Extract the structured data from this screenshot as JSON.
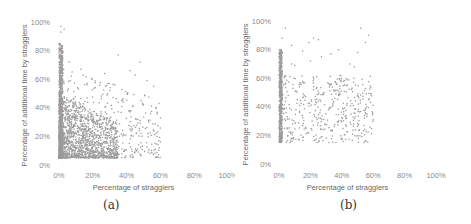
{
  "chart_data": [
    {
      "type": "scatter",
      "caption": "(a)",
      "title": "",
      "xlabel": "Percentage of stragglers",
      "ylabel": "Percentage of additional time by stragglers",
      "xlim": [
        0,
        100
      ],
      "ylim": [
        0,
        100
      ],
      "xticks": [
        "0%",
        "20%",
        "40%",
        "60%",
        "80%",
        "100%"
      ],
      "yticks": [
        "0%",
        "20%",
        "40%",
        "60%",
        "80%",
        "100%"
      ],
      "grid": false,
      "legend": "none",
      "point_color": "#9b9b9b",
      "distribution": {
        "description": "Dense cluster near x=0-20%, y=5-40%, concentrated column at x≈0-2% spanning up to ~98%; sparse tail to x≈60%",
        "count": 2600,
        "x_range": [
          0,
          60
        ],
        "y_range": [
          5,
          98
        ],
        "seed": 7
      },
      "notable_points": [
        {
          "x": 1,
          "y": 97
        },
        {
          "x": 3,
          "y": 95
        },
        {
          "x": 1,
          "y": 93
        },
        {
          "x": 6,
          "y": 72
        },
        {
          "x": 13,
          "y": 67
        },
        {
          "x": 27,
          "y": 64
        },
        {
          "x": 35,
          "y": 77
        },
        {
          "x": 48,
          "y": 72
        },
        {
          "x": 42,
          "y": 66
        },
        {
          "x": 45,
          "y": 63
        },
        {
          "x": 52,
          "y": 59
        },
        {
          "x": 56,
          "y": 55
        },
        {
          "x": 58,
          "y": 20
        },
        {
          "x": 59,
          "y": 17
        },
        {
          "x": 57,
          "y": 11
        },
        {
          "x": 50,
          "y": 42
        },
        {
          "x": 38,
          "y": 44
        },
        {
          "x": 33,
          "y": 56
        }
      ]
    },
    {
      "type": "scatter",
      "caption": "(b)",
      "title": "",
      "xlabel": "Percentage of stragglers",
      "ylabel": "Percentage of additional time by stragglers",
      "xlim": [
        0,
        100
      ],
      "ylim": [
        0,
        100
      ],
      "xticks": [
        "0%",
        "20%",
        "40%",
        "60%",
        "80%",
        "100%"
      ],
      "yticks": [
        "0%",
        "20%",
        "40%",
        "60%",
        "80%",
        "100%"
      ],
      "grid": false,
      "legend": "none",
      "point_color": "#9b9b9b",
      "distribution": {
        "description": "Dense vertical column at x≈0-2% spanning y≈15-80%; sparse points across x≈3-60%, y≈15-60%",
        "count": 900,
        "x_range": [
          0,
          60
        ],
        "y_range": [
          14,
          96
        ],
        "seed": 13
      },
      "notable_points": [
        {
          "x": 4,
          "y": 95
        },
        {
          "x": 52,
          "y": 95
        },
        {
          "x": 2,
          "y": 88
        },
        {
          "x": 57,
          "y": 90
        },
        {
          "x": 22,
          "y": 88
        },
        {
          "x": 25,
          "y": 87
        },
        {
          "x": 19,
          "y": 85
        },
        {
          "x": 55,
          "y": 85
        },
        {
          "x": 8,
          "y": 83
        },
        {
          "x": 15,
          "y": 79
        },
        {
          "x": 38,
          "y": 80
        },
        {
          "x": 50,
          "y": 78
        },
        {
          "x": 33,
          "y": 77
        },
        {
          "x": 27,
          "y": 75
        },
        {
          "x": 20,
          "y": 72
        },
        {
          "x": 45,
          "y": 70
        },
        {
          "x": 48,
          "y": 68
        },
        {
          "x": 8,
          "y": 70
        },
        {
          "x": 10,
          "y": 69
        }
      ]
    }
  ]
}
